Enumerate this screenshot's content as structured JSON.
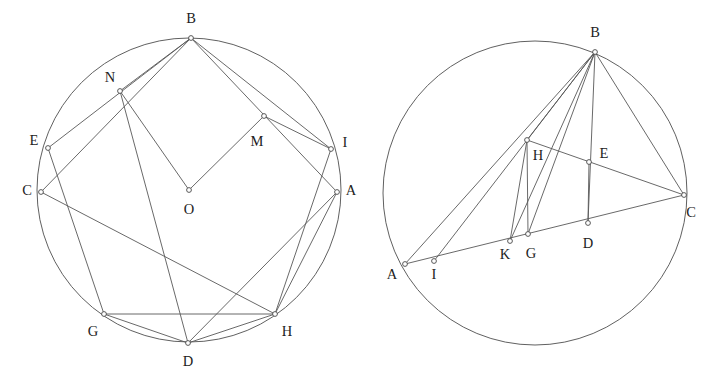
{
  "figure": {
    "background_color": "#ffffff",
    "stroke_color": "#585858",
    "label_color": "#1d1d1d",
    "width": 715,
    "height": 387
  },
  "diagrams": [
    {
      "name": "left-construction",
      "circle": {
        "cx": 189,
        "cy": 190,
        "r": 152
      },
      "points": [
        {
          "id": "B",
          "label": "B",
          "x": 191,
          "y": 38,
          "lx": 191,
          "ly": 20,
          "anchor": "middle"
        },
        {
          "id": "N",
          "label": "N",
          "x": 120,
          "y": 91,
          "lx": 110,
          "ly": 79,
          "anchor": "middle"
        },
        {
          "id": "E",
          "label": "E",
          "x": 48,
          "y": 148,
          "lx": 34,
          "ly": 142,
          "anchor": "middle"
        },
        {
          "id": "C",
          "label": "C",
          "x": 41,
          "y": 192,
          "lx": 27,
          "ly": 192,
          "anchor": "middle"
        },
        {
          "id": "G",
          "label": "G",
          "x": 104,
          "y": 314,
          "lx": 93,
          "ly": 333,
          "anchor": "middle"
        },
        {
          "id": "D",
          "label": "D",
          "x": 188,
          "y": 343,
          "lx": 188,
          "ly": 363,
          "anchor": "middle"
        },
        {
          "id": "H",
          "label": "H",
          "x": 275,
          "y": 314,
          "lx": 287,
          "ly": 333,
          "anchor": "middle"
        },
        {
          "id": "A",
          "label": "A",
          "x": 337,
          "y": 192,
          "lx": 351,
          "ly": 192,
          "anchor": "middle"
        },
        {
          "id": "I",
          "label": "I",
          "x": 331,
          "y": 149,
          "lx": 345,
          "ly": 144,
          "anchor": "middle"
        },
        {
          "id": "M",
          "label": "M",
          "x": 264,
          "y": 116,
          "lx": 257,
          "ly": 143,
          "anchor": "middle"
        },
        {
          "id": "O",
          "label": "O",
          "x": 189,
          "y": 190,
          "lx": 189,
          "ly": 211,
          "anchor": "middle"
        }
      ],
      "segments": [
        {
          "from": "B",
          "to": "E"
        },
        {
          "from": "B",
          "to": "C"
        },
        {
          "from": "B",
          "to": "I"
        },
        {
          "from": "B",
          "to": "A"
        },
        {
          "from": "B",
          "to": "N"
        },
        {
          "from": "N",
          "to": "O"
        },
        {
          "from": "O",
          "to": "M"
        },
        {
          "from": "M",
          "to": "I"
        },
        {
          "from": "N",
          "to": "D"
        },
        {
          "from": "E",
          "to": "G"
        },
        {
          "from": "C",
          "to": "H"
        },
        {
          "from": "G",
          "to": "H"
        },
        {
          "from": "G",
          "to": "D"
        },
        {
          "from": "D",
          "to": "H"
        },
        {
          "from": "D",
          "to": "A"
        },
        {
          "from": "I",
          "to": "H"
        },
        {
          "from": "A",
          "to": "H"
        }
      ]
    },
    {
      "name": "right-construction",
      "circle": {
        "cx": 535,
        "cy": 193,
        "r": 152
      },
      "points": [
        {
          "id": "B",
          "label": "B",
          "x": 595,
          "y": 52,
          "lx": 595,
          "ly": 34,
          "anchor": "middle"
        },
        {
          "id": "H",
          "label": "H",
          "x": 527,
          "y": 140,
          "lx": 538,
          "ly": 157,
          "anchor": "middle"
        },
        {
          "id": "E",
          "label": "E",
          "x": 589,
          "y": 162,
          "lx": 604,
          "ly": 155,
          "anchor": "middle"
        },
        {
          "id": "C",
          "label": "C",
          "x": 684,
          "y": 195,
          "lx": 691,
          "ly": 214,
          "anchor": "middle"
        },
        {
          "id": "D",
          "label": "D",
          "x": 588,
          "y": 223,
          "lx": 588,
          "ly": 245,
          "anchor": "middle"
        },
        {
          "id": "G",
          "label": "G",
          "x": 528,
          "y": 234,
          "lx": 531,
          "ly": 255,
          "anchor": "middle"
        },
        {
          "id": "K",
          "label": "K",
          "x": 510,
          "y": 241,
          "lx": 505,
          "ly": 256,
          "anchor": "middle"
        },
        {
          "id": "I",
          "label": "I",
          "x": 434,
          "y": 261,
          "lx": 434,
          "ly": 276,
          "anchor": "middle"
        },
        {
          "id": "A",
          "label": "A",
          "x": 405,
          "y": 264,
          "lx": 392,
          "ly": 276,
          "anchor": "middle"
        }
      ],
      "segments": [
        {
          "from": "A",
          "to": "C"
        },
        {
          "from": "A",
          "to": "B"
        },
        {
          "from": "I",
          "to": "B"
        },
        {
          "from": "K",
          "to": "B"
        },
        {
          "from": "G",
          "to": "B"
        },
        {
          "from": "H",
          "to": "B"
        },
        {
          "from": "B",
          "to": "D"
        },
        {
          "from": "B",
          "to": "C"
        },
        {
          "from": "H",
          "to": "C"
        },
        {
          "from": "H",
          "to": "G"
        },
        {
          "from": "H",
          "to": "K"
        },
        {
          "from": "E",
          "to": "D"
        }
      ]
    }
  ]
}
